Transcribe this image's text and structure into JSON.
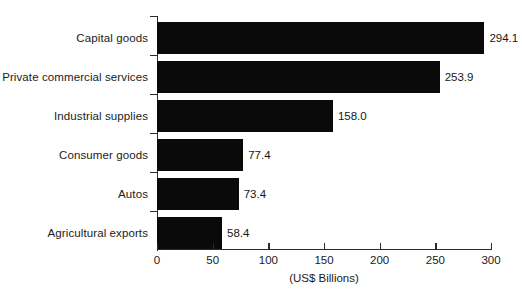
{
  "chart_data": {
    "type": "bar",
    "orientation": "horizontal",
    "title": "",
    "xlabel": "(US$ Billions)",
    "ylabel": "",
    "xlim": [
      0,
      300
    ],
    "xticks": [
      0,
      50,
      100,
      150,
      200,
      250,
      300
    ],
    "xtick_labels": [
      "0",
      "50",
      "100",
      "150",
      "200",
      "250",
      "300"
    ],
    "grid": false,
    "legend": null,
    "bar_color": "#0a0a0a",
    "categories": [
      "Capital goods",
      "Private commercial services",
      "Industrial supplies",
      "Consumer goods",
      "Autos",
      "Agricultural exports"
    ],
    "values": [
      294.1,
      253.9,
      158.0,
      77.4,
      73.4,
      58.4
    ],
    "value_labels": [
      "294.1",
      "253.9",
      "158.0",
      "77.4",
      "73.4",
      "58.4"
    ]
  }
}
